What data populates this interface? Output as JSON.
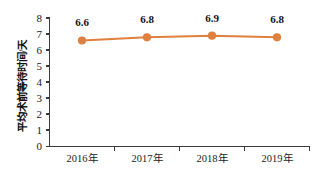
{
  "chart_data": {
    "type": "line",
    "title": "",
    "subtitle": "",
    "xlabel": "",
    "ylabel": "平均术前等待时间/天",
    "categories": [
      "2016年",
      "2017年",
      "2018年",
      "2019年"
    ],
    "values": [
      6.6,
      6.8,
      6.9,
      6.8
    ],
    "point_labels": [
      "6.6",
      "6.8",
      "6.9",
      "6.8"
    ],
    "series": [
      {
        "name": "平均术前等待时间/天",
        "values": [
          6.6,
          6.8,
          6.9,
          6.8
        ],
        "color": "#e0803f"
      }
    ],
    "ylim": [
      0,
      8
    ],
    "ytick_labels": [
      "0",
      "1",
      "2",
      "3",
      "4",
      "5",
      "6",
      "7",
      "8"
    ],
    "ytick_values": [
      0,
      1,
      2,
      3,
      4,
      5,
      6,
      7,
      8
    ],
    "grid": false,
    "legend": false,
    "legend_position": "none",
    "colors": {
      "series": "#e0803f",
      "marker": "#e0803f",
      "axis": "#3a3a3a",
      "text": "#111111",
      "background": "#ffffff"
    }
  },
  "axes": {
    "y_title": "平均术前等待时间/天",
    "y_ticks": [
      "8",
      "7",
      "6",
      "5",
      "4",
      "3",
      "2",
      "1",
      "0"
    ],
    "x_ticks": [
      "2016年",
      "2017年",
      "2018年",
      "2019年"
    ]
  }
}
